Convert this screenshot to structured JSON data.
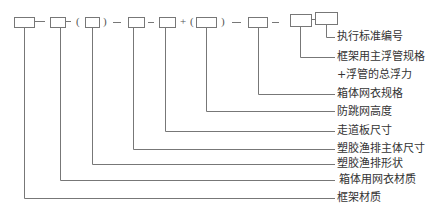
{
  "diagram": {
    "type": "code-structure-notation",
    "colors": {
      "line": "#777777",
      "text": "#333333",
      "background": "#ffffff"
    },
    "code_sequence": [
      "box",
      "-",
      "box",
      "-",
      "(",
      "box",
      ")",
      "-",
      "box",
      "-",
      "box",
      "+",
      "(",
      "box",
      ")",
      "-",
      "box",
      "-",
      "box",
      "box"
    ],
    "separators": {
      "dash": "—",
      "plus": "+",
      "open_paren": "(",
      "close_paren": ")"
    },
    "labels": [
      {
        "id": "standard-no",
        "text": "执行标准编号"
      },
      {
        "id": "main-float-pipe-spec",
        "text": "框架用主浮管规格"
      },
      {
        "id": "total-buoyancy",
        "text": "+浮管的总浮力"
      },
      {
        "id": "cage-net-spec",
        "text": "箱体网衣规格"
      },
      {
        "id": "anti-jump-net-height",
        "text": "防跳网高度"
      },
      {
        "id": "walkway-size",
        "text": "走道板尺寸"
      },
      {
        "id": "raft-main-size",
        "text": "塑胶渔排主体尺寸"
      },
      {
        "id": "raft-shape",
        "text": "塑胶渔排形状"
      },
      {
        "id": "cage-net-material",
        "text": "箱体用网衣材质"
      },
      {
        "id": "frame-material",
        "text": "框架材质"
      }
    ]
  }
}
